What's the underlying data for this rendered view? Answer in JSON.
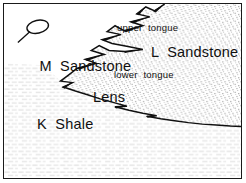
{
  "figure": {
    "kind": "geologic-cross-section",
    "width": 246,
    "height": 183,
    "background_color": "#ffffff",
    "frame_color": "#1a1a1a",
    "line_color": "#101010"
  },
  "units": {
    "m_sandstone": {
      "label_line1": "M  Sandstone",
      "label_line2": "Lens",
      "fill": "blank",
      "fill_color": "#ffffff"
    },
    "l_sandstone": {
      "label": "L  Sandstone",
      "fill": "stipple",
      "fill_color": "#d8d8d8"
    },
    "k_shale": {
      "label": "K  Shale",
      "fill": "horizontal-dash",
      "fill_color": "#dcdcdc"
    }
  },
  "annotations": {
    "upper_tongue": "upper  tongue",
    "lower_tongue": "lower  tongue"
  },
  "lens": {
    "name": "sandstone-lens-ellipse",
    "cx": 37,
    "cy": 26,
    "rx": 11,
    "ry": 6.5,
    "rotation": -12,
    "leader_from_x": 29,
    "leader_from_y": 31,
    "leader_to_x": 17,
    "leader_to_y": 42
  },
  "contact_zigzag": {
    "description": "interfingering contact between M Sandstone and L Sandstone",
    "points": "162,1 152,7 143,3 134,10 147,13 128,18 140,22 121,27 112,22 104,28 118,31 99,36 109,40 125,43 140,46 122,48 106,47 96,42 88,47 101,51 82,56 93,60 74,65 65,72 57,78 69,79 60,84 72,88 85,92 97,96 110,99 124,103 112,103 126,107 140,110 154,112 144,112 158,115 172,117 186,119 200,121 214,122 228,123 240,124"
  },
  "lower_contact": {
    "description": "base of L Sandstone running to right frame edge",
    "points": "57,78 85,92 120,104 155,113 190,119 239,124"
  }
}
